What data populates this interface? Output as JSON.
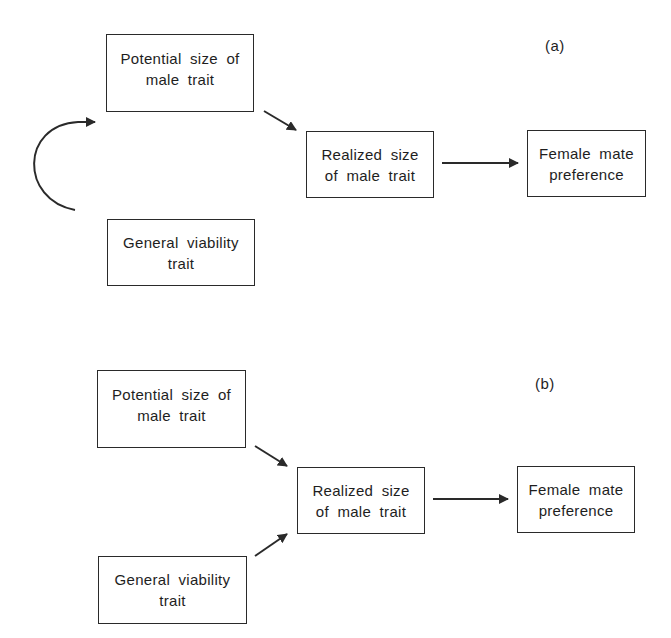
{
  "panels": {
    "a": {
      "label": "(a)",
      "nodes": {
        "potential": {
          "lines": [
            "Potential size of",
            "male trait"
          ]
        },
        "viability": {
          "lines": [
            "General viability",
            "trait"
          ]
        },
        "realized": {
          "lines": [
            "Realized size",
            "of male trait"
          ]
        },
        "preference": {
          "lines": [
            "Female mate",
            "preference"
          ]
        }
      },
      "edges": [
        {
          "from": "viability",
          "to": "potential",
          "style": "curved"
        },
        {
          "from": "potential",
          "to": "realized",
          "style": "straight"
        },
        {
          "from": "realized",
          "to": "preference",
          "style": "straight"
        }
      ]
    },
    "b": {
      "label": "(b)",
      "nodes": {
        "potential": {
          "lines": [
            "Potential size of",
            "male trait"
          ]
        },
        "viability": {
          "lines": [
            "General viability",
            "trait"
          ]
        },
        "realized": {
          "lines": [
            "Realized size",
            "of male trait"
          ]
        },
        "preference": {
          "lines": [
            "Female mate",
            "preference"
          ]
        }
      },
      "edges": [
        {
          "from": "potential",
          "to": "realized",
          "style": "straight"
        },
        {
          "from": "viability",
          "to": "realized",
          "style": "straight"
        },
        {
          "from": "realized",
          "to": "preference",
          "style": "straight"
        }
      ]
    }
  },
  "colors": {
    "stroke": "#2a2a2a",
    "text": "#1e1e1e",
    "background": "#ffffff"
  }
}
